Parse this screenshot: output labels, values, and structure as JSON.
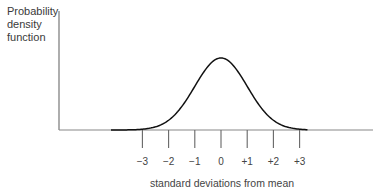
{
  "chart_data": {
    "type": "line",
    "title": "",
    "ylabel_lines": [
      "Probability",
      "density",
      "function"
    ],
    "ylabel": "Probability density function",
    "xlabel": "standard deviations from mean",
    "tick_labels": [
      "−3",
      "−2",
      "−1",
      "0",
      "+1",
      "+2",
      "+3"
    ],
    "tick_values": [
      -3,
      -2,
      -1,
      0,
      1,
      2,
      3
    ],
    "series": [
      {
        "name": "normal distribution",
        "function": "standard normal pdf",
        "mean": 0,
        "sd": 1
      }
    ],
    "xlim": [
      -4.6,
      5.9
    ],
    "grid": false,
    "legend": "none",
    "line_color": "#111111",
    "axis_color": "#777777"
  }
}
